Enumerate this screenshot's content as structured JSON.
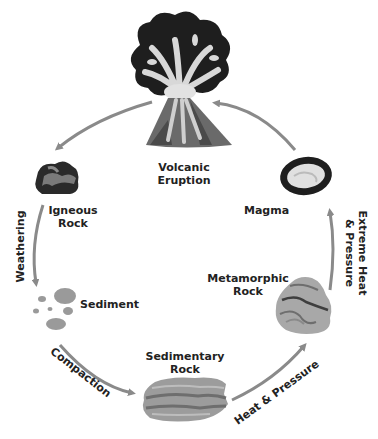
{
  "diagram": {
    "type": "rock-cycle",
    "colors": {
      "arrow": "#8a8a8a",
      "dark": "#1e1e1e",
      "mid": "#707070",
      "light": "#c8c8c8",
      "text": "#222222"
    },
    "nodes": {
      "volcanic_eruption": {
        "line1": "Volcanic",
        "line2": "Eruption",
        "icon": "volcano-icon"
      },
      "igneous_rock": {
        "line1": "Igneous",
        "line2": "Rock",
        "icon": "igneous-rock-icon"
      },
      "sediment": {
        "line1": "Sediment",
        "icon": "sediment-pebbles-icon"
      },
      "sedimentary_rock": {
        "line1": "Sedimentary",
        "line2": "Rock",
        "icon": "sedimentary-rock-icon"
      },
      "metamorphic_rock": {
        "line1": "Metamorphic",
        "line2": "Rock",
        "icon": "metamorphic-rock-icon"
      },
      "magma": {
        "line1": "Magma",
        "icon": "magma-icon"
      }
    },
    "processes": {
      "weathering": "Weathering",
      "compaction": "Compaction",
      "heat_pressure": "Heat & Pressure",
      "extreme_heat_line1": "Extreme Heat",
      "extreme_heat_line2": "& Pressure"
    }
  }
}
